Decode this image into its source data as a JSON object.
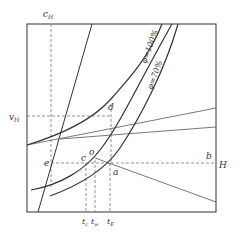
{
  "diagram": {
    "type": "psychrometric-style enthalpy diagram",
    "colors": {
      "line": "#333333",
      "dashed": "#777777",
      "background": "#ffffff"
    },
    "labels": {
      "c": "c",
      "c_sub": "H",
      "v": "v",
      "v_sub": "H",
      "H": "H",
      "b": "b",
      "d": "d",
      "e": "e",
      "o": "o",
      "c_point": "c",
      "a": "a",
      "t_c": "t",
      "t_c_sub": "c",
      "t_w": "t",
      "t_w_sub": "w",
      "t_E": "t",
      "t_E_sub": "E",
      "phi100": "φ=100%",
      "phi70": "φ=70%"
    }
  }
}
